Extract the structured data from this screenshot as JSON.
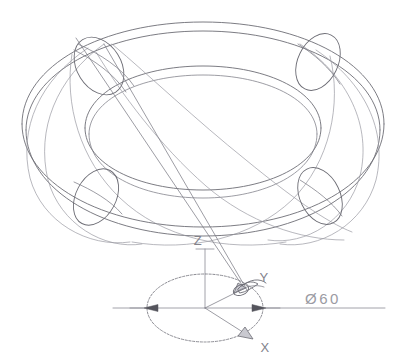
{
  "drawing": {
    "title": "Torus wireframe isometric construction",
    "type": "cad-technical-drawing",
    "background_color": "#ffffff",
    "line_color": "#6d6d75",
    "canvas": {
      "width": 406,
      "height": 360
    }
  },
  "labels": {
    "axis_z": "Z",
    "axis_y": "Y",
    "axis_x": "X",
    "diameter_dimension": "Ø60"
  },
  "geometry": {
    "torus": {
      "center": {
        "x": 203,
        "y": 128
      },
      "outer_ellipse_rx": 182,
      "outer_ellipse_ry": 104,
      "inner_ellipse_rx": 118,
      "inner_ellipse_ry": 62,
      "tube_offset_y": 26,
      "cross_sections": 4
    },
    "base_circle": {
      "center": {
        "x": 205,
        "y": 308
      },
      "rx": 58,
      "ry": 34,
      "style": "dashed-centerline"
    },
    "dimension_line": {
      "y": 308,
      "x_start": 113,
      "x_end": 385
    }
  },
  "elements": {
    "torus_outline": "torus-wireframe",
    "leader_line": "cross-section-leader",
    "origin": {
      "x": 205,
      "y": 308
    }
  }
}
